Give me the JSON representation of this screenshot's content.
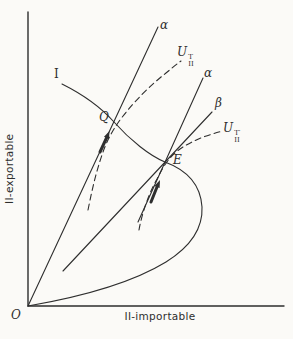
{
  "figure": {
    "origin_label": "O",
    "y_axis_label": "II-exportable",
    "x_axis_label": "II-importable",
    "offer_curve_label": "I",
    "point_labels": {
      "q": "Q",
      "e": "E"
    },
    "ray_labels": {
      "alpha_1": "α",
      "alpha_2": "α",
      "beta": "β"
    },
    "utility_labels": {
      "u_t": {
        "base": "U",
        "sup": "T",
        "sub": "II"
      },
      "u_t_prime": {
        "base": "U",
        "sup": "T′",
        "sub": "II"
      }
    },
    "colors": {
      "ink": "#2e2e2e",
      "background": "#fbfaf7"
    }
  }
}
